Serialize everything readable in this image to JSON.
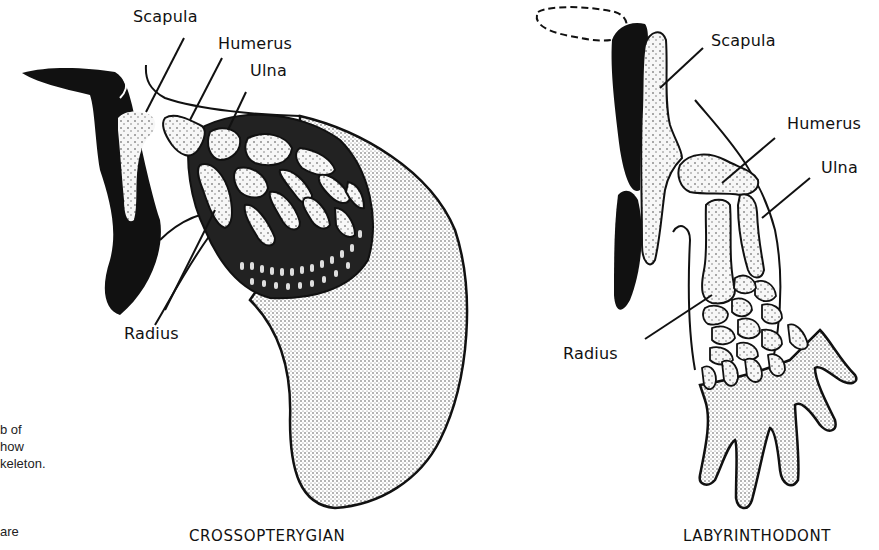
{
  "figures": [
    {
      "id": "crossopterygian",
      "caption": "CROSSOPTERYGIAN",
      "labels": {
        "scapula": "Scapula",
        "humerus": "Humerus",
        "ulna": "Ulna",
        "radius": "Radius"
      }
    },
    {
      "id": "labyrinthodont",
      "caption": "LABYRINTHODONT",
      "labels": {
        "scapula": "Scapula",
        "humerus": "Humerus",
        "ulna": "Ulna",
        "radius": "Radius"
      }
    }
  ],
  "side_caption_fragments": [
    "b of",
    "how",
    "keleton.",
    "",
    "are"
  ],
  "colors": {
    "bone_fill": "#f2f2f2",
    "ink": "#111111",
    "fin_stipple": "#e6e6e6",
    "background": "#ffffff"
  }
}
